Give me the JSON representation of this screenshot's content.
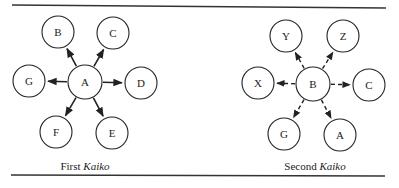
{
  "figure": {
    "panels": [
      {
        "id": "first",
        "caption_prefix": "First",
        "caption_italic": "Kaiko",
        "edge_style": "solid",
        "center": {
          "label": "A",
          "x": 85,
          "y": 82
        },
        "nodes": [
          {
            "label": "B",
            "x": 58,
            "y": 32
          },
          {
            "label": "C",
            "x": 113,
            "y": 33
          },
          {
            "label": "G",
            "x": 29,
            "y": 81
          },
          {
            "label": "D",
            "x": 141,
            "y": 83
          },
          {
            "label": "F",
            "x": 56,
            "y": 132
          },
          {
            "label": "E",
            "x": 112,
            "y": 133
          }
        ]
      },
      {
        "id": "second",
        "caption_prefix": "Second",
        "caption_italic": "Kaiko",
        "edge_style": "dashed",
        "center": {
          "label": "B",
          "x": 313,
          "y": 84
        },
        "nodes": [
          {
            "label": "Y",
            "x": 286,
            "y": 36
          },
          {
            "label": "Z",
            "x": 343,
            "y": 36
          },
          {
            "label": "X",
            "x": 258,
            "y": 83
          },
          {
            "label": "C",
            "x": 369,
            "y": 85
          },
          {
            "label": "G",
            "x": 284,
            "y": 134
          },
          {
            "label": "A",
            "x": 340,
            "y": 135
          }
        ]
      }
    ],
    "node_radius": 17,
    "colors": {
      "stroke": "#222222",
      "rule": "#333333",
      "background": "#ffffff"
    }
  }
}
